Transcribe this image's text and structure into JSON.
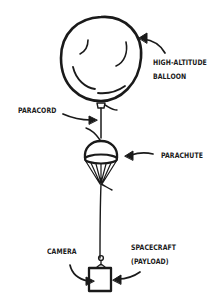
{
  "diagram": {
    "colors": {
      "ink": "#1a1a1a",
      "background": "#ffffff"
    },
    "labels": {
      "balloon": [
        "HIGH-ALTITUDE",
        "BALLOON"
      ],
      "paracord": "PARACORD",
      "parachute": "PARACHUTE",
      "camera": "CAMERA",
      "spacecraft": [
        "SPACECRAFT",
        "(PAYLOAD)"
      ]
    },
    "components": [
      "balloon",
      "paracord",
      "parachute",
      "spacecraft-box",
      "camera"
    ]
  }
}
